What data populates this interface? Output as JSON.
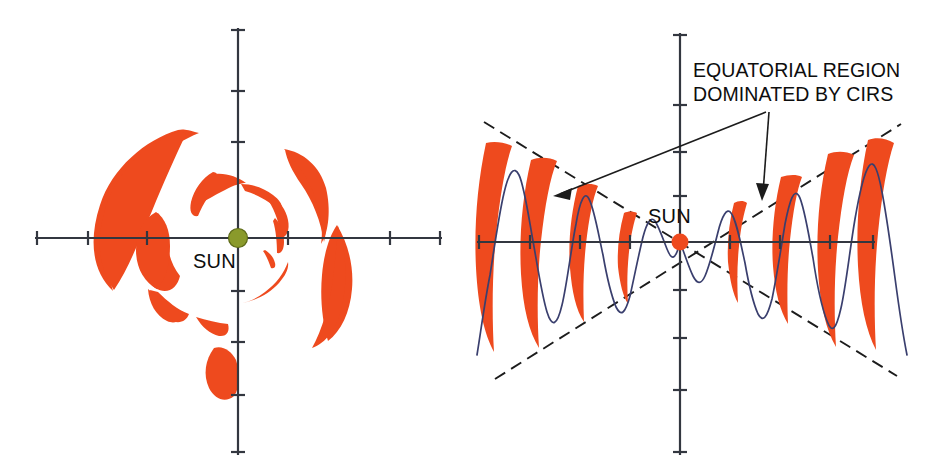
{
  "figure": {
    "width": 941,
    "height": 475,
    "background": "#ffffff"
  },
  "colors": {
    "cir_orange": "#ee4a1e",
    "sun_left_olive": "#8a9a2b",
    "sun_right_orange": "#ee4a1e",
    "wave_navy": "#3a3f6e",
    "axis_gray": "#333740",
    "dash_black": "#1c1c1c",
    "text_black": "#0d0d0d"
  },
  "left_panel": {
    "name": "ecliptic-plane-view",
    "sun_label": "SUN",
    "sun": {
      "cx": 238,
      "cy": 238,
      "r": 9.5,
      "color": "#8a9a2b"
    },
    "axes": {
      "x_start": 35,
      "x_end": 442,
      "y_start": 28,
      "y_end": 455,
      "cx": 238,
      "cy": 238,
      "x_ticks": [
        88,
        148,
        238,
        328,
        388
      ],
      "y_ticks": [
        90,
        140,
        190,
        238,
        288,
        338,
        388
      ],
      "tick_half_length": 7
    },
    "cir_shapes": 11
  },
  "right_panel": {
    "name": "meridional-plane-view",
    "sun_label": "SUN",
    "sun": {
      "cx": 680,
      "cy": 242,
      "r": 8.5,
      "color": "#ee4a1e"
    },
    "axes": {
      "x_start": 477,
      "x_end": 875,
      "y_start": 33,
      "y_end": 455,
      "cx": 680,
      "cy": 242,
      "x_ticks": [
        482,
        530,
        580,
        630,
        730,
        780,
        830,
        872
      ],
      "y_ticks": [
        38,
        106,
        152,
        196,
        290,
        338,
        390,
        452
      ],
      "tick_half_length": 7
    },
    "wave": {
      "description": "navy sinusoid, amplitude grows with heliocentric distance",
      "cycles_per_side": 4,
      "stroke": "#3a3f6e"
    },
    "dashed_wedge": {
      "description": "two dashed straight lines crossing at the Sun, bounding the equatorial region",
      "upper_left_end": [
        484,
        122
      ],
      "upper_right_end": [
        901,
        124
      ],
      "lower_left_end": [
        495,
        379
      ],
      "lower_right_end": [
        897,
        376
      ],
      "half_angle_deg": 18
    },
    "cir_shapes": 8,
    "annotation": {
      "line1": "EQUATORIAL REGION",
      "line2": "DOMINATED BY CIRS",
      "text_x": 693,
      "text_y1": 77,
      "text_y2": 101,
      "arrows": [
        {
          "name": "arrow-to-left-cirs",
          "from": [
            765,
            113
          ],
          "to": [
            556,
            196
          ]
        },
        {
          "name": "arrow-to-right-cirs",
          "from": [
            768,
            113
          ],
          "to": [
            763,
            200
          ]
        }
      ]
    }
  }
}
